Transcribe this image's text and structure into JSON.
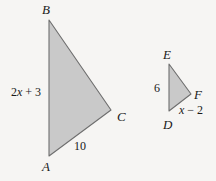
{
  "figure": {
    "background_color": "#f6f5f3",
    "fill_color": "#c9c9c9",
    "stroke_color": "#6e6e6e",
    "text_color": "#1a1a1a",
    "triangles": [
      {
        "id": "large",
        "name": "triangle-abc",
        "vertices": [
          {
            "label": "B",
            "x": 49,
            "y": 20
          },
          {
            "label": "C",
            "x": 111,
            "y": 110
          },
          {
            "label": "A",
            "x": 49,
            "y": 156
          }
        ],
        "side_labels": [
          {
            "label": "2x + 3",
            "side": "AB"
          },
          {
            "label": "10",
            "side": "AC"
          }
        ]
      },
      {
        "id": "small",
        "name": "triangle-def",
        "vertices": [
          {
            "label": "E",
            "x": 169,
            "y": 64
          },
          {
            "label": "F",
            "x": 191,
            "y": 94
          },
          {
            "label": "D",
            "x": 169,
            "y": 111
          }
        ],
        "side_labels": [
          {
            "label": "6",
            "side": "DE"
          },
          {
            "label": "x − 2",
            "side": "DF"
          }
        ]
      }
    ]
  },
  "labels": {
    "B": "B",
    "A": "A",
    "C": "C",
    "E": "E",
    "D": "D",
    "F": "F",
    "side_ab_coefficient": "2",
    "side_ab_variable": "x",
    "side_ab_constant": " + 3",
    "side_ac": "10",
    "side_de": "6",
    "side_df_variable": "x",
    "side_df_constant": " − 2"
  }
}
